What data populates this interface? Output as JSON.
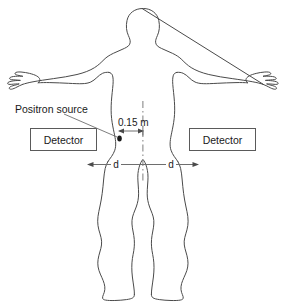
{
  "figure": {
    "type": "physics-schematic",
    "background_color": "#ffffff",
    "outline_color": "#4a4a4a",
    "line_color": "#6e6e6e",
    "text_color": "#1a1a1a"
  },
  "labels": {
    "positron_source": "Positron source",
    "detector_left": "Detector",
    "detector_right": "Detector",
    "offset_distance": "0.15 m",
    "distance_left": "d",
    "distance_right": "d"
  },
  "annotations": {
    "offset_value": "0.15",
    "offset_unit": "m",
    "symmetric_distance_symbol": "d",
    "centerline_style": "dash-dot",
    "source_marker": "filled-dot"
  },
  "icons": {
    "source_dot": "filled-circle-marker",
    "arrow_left": "left-arrowhead",
    "arrow_right": "right-arrowhead",
    "centerline": "dash-dot-axis"
  }
}
